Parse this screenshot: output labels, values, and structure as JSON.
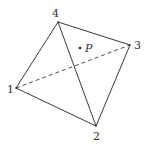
{
  "diagram": {
    "type": "tetrahedron-projection",
    "vertices": [
      {
        "id": "1",
        "label": "1",
        "x": 16,
        "y": 88,
        "label_x": 7,
        "label_y": 93
      },
      {
        "id": "2",
        "label": "2",
        "x": 96,
        "y": 126,
        "label_x": 93,
        "label_y": 140
      },
      {
        "id": "3",
        "label": "3",
        "x": 130,
        "y": 45,
        "label_x": 134,
        "label_y": 49
      },
      {
        "id": "4",
        "label": "4",
        "x": 58,
        "y": 22,
        "label_x": 52,
        "label_y": 17
      }
    ],
    "edges": [
      {
        "from": "1",
        "to": "4",
        "style": "solid"
      },
      {
        "from": "4",
        "to": "3",
        "style": "solid"
      },
      {
        "from": "3",
        "to": "2",
        "style": "solid"
      },
      {
        "from": "2",
        "to": "1",
        "style": "solid"
      },
      {
        "from": "4",
        "to": "2",
        "style": "solid"
      },
      {
        "from": "1",
        "to": "3",
        "style": "dashed"
      }
    ],
    "point": {
      "label": "P",
      "x": 80,
      "y": 48,
      "label_x": 85,
      "label_y": 52
    },
    "colors": {
      "stroke": "#3a3a3a",
      "text": "#333333",
      "background": "#ffffff"
    }
  }
}
